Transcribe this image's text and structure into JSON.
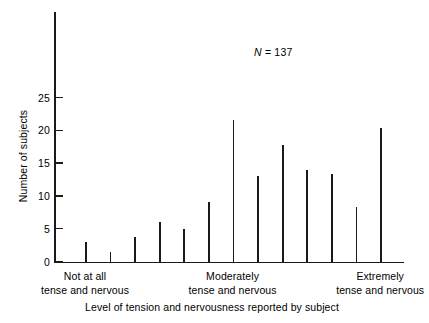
{
  "chart_data": {
    "type": "bar",
    "title": "",
    "subtitle": "",
    "xlabel": "Level of tension and nervousness reported by subject",
    "ylabel": "Number of subjects",
    "annotation": "N = 137",
    "annotation_symbol": "N",
    "annotation_rest": " = 137",
    "grid": false,
    "legend": false,
    "ylim": [
      0,
      30
    ],
    "yticks": [
      0,
      5,
      10,
      15,
      20,
      25
    ],
    "ytick_labels": [
      "0",
      "5",
      "10",
      "15",
      "20",
      "25"
    ],
    "categories": [
      "1",
      "2",
      "3",
      "4",
      "5",
      "6",
      "7",
      "8",
      "9",
      "10",
      "11",
      "12",
      "13",
      "14"
    ],
    "values": [
      3,
      1.5,
      3.7,
      6,
      5,
      9,
      21.5,
      13,
      17.7,
      14,
      13.4,
      8.3,
      20.3,
      0
    ],
    "xtick_group_labels": [
      {
        "line1": "Not at all",
        "line2": "tense and nervous",
        "position": 1
      },
      {
        "line1": "Moderately",
        "line2": "tense and nervous",
        "position": 7
      },
      {
        "line1": "Extremely",
        "line2": "tense and nervous",
        "position": 13
      }
    ],
    "bar_color": "#1a1a1a",
    "axis_color": "#1a1a1a",
    "background_color": "#ffffff"
  }
}
